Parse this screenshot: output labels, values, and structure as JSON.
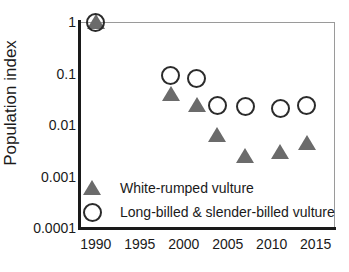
{
  "chart_data": {
    "type": "scatter",
    "title": "",
    "xlabel": "",
    "ylabel": "Population index",
    "xlim": [
      1988.2,
      2017.2
    ],
    "ylim": [
      0.0001,
      1
    ],
    "yscale": "log",
    "grid": false,
    "legend_position": "inside-lower-left",
    "xticks": [
      "1990",
      "1995",
      "2000",
      "2005",
      "2010",
      "2015"
    ],
    "xtick_values": [
      1990,
      1995,
      2000,
      2005,
      2010,
      2015
    ],
    "yticks": [
      "1",
      "0.1",
      "0.01",
      "0.001",
      "0.0001"
    ],
    "ytick_values": [
      1,
      0.1,
      0.01,
      0.001,
      0.0001
    ],
    "series": [
      {
        "name": "White-rumped vulture",
        "marker": "filled-triangle",
        "color": "#6b6b6b",
        "x": [
          1990,
          1998.5,
          2001.5,
          2003.8,
          2007,
          2011,
          2014
        ],
        "values": [
          1.0,
          0.04,
          0.025,
          0.0065,
          0.0025,
          0.003,
          0.0045
        ]
      },
      {
        "name": "Long-billed & slender-billed vulture",
        "marker": "open-circle",
        "color": "#2b2b2b",
        "x": [
          1990,
          1998.5,
          2001.5,
          2003.8,
          2007,
          2011,
          2014
        ],
        "values": [
          1.0,
          0.09,
          0.08,
          0.024,
          0.023,
          0.021,
          0.024
        ]
      }
    ]
  },
  "legend": {
    "entries": [
      {
        "label": "White-rumped vulture",
        "marker": "filled-triangle"
      },
      {
        "label": "Long-billed & slender-billed vulture",
        "marker": "open-circle"
      }
    ]
  }
}
